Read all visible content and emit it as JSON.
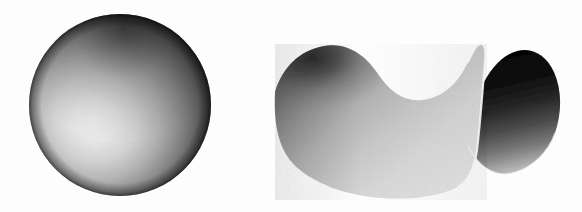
{
  "page": {
    "background_color": "#fefefe",
    "width": 582,
    "height": 212
  },
  "figures": [
    {
      "id": "sphere",
      "name": "sphere",
      "label": "Sphere",
      "shape": "sphere",
      "curvature_sign": "positive",
      "render_style": "airbrush-grayscale",
      "center_x": 120,
      "center_y": 105,
      "radius": 91,
      "highlight_x": 98,
      "highlight_y": 118,
      "highlight_color": "#f2f2f2",
      "midtone_color": "#9a9a9a",
      "shadow_color": "#2a2a2a",
      "edge_color": "#1a1a1a"
    },
    {
      "id": "saddle",
      "name": "saddle-surface",
      "label": "Saddle surface",
      "shape": "hyperbolic-paraboloid",
      "curvature_sign": "negative",
      "render_style": "airbrush-grayscale",
      "bounds": {
        "x": 275,
        "y": 48,
        "width": 275,
        "height": 152
      },
      "front_highlight_color": "#ededed",
      "front_midtone_color": "#b4b4b4",
      "left_shadow_color": "#4e4e4e",
      "back_shadow_color": "#101010",
      "underside_color": "#080808"
    }
  ],
  "artifacts": [
    {
      "name": "scan-smudge",
      "text": "",
      "x": 337,
      "y": 30,
      "color": "#efefef"
    }
  ]
}
